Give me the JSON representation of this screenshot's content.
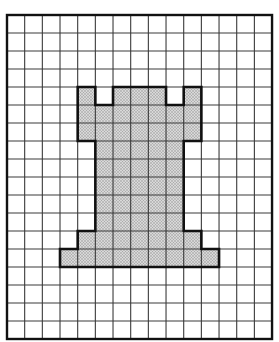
{
  "diagram": {
    "type": "grid-pixel-art",
    "grid": {
      "columns": 15,
      "rows": 18,
      "origin_px": [
        7,
        15
      ],
      "cell_width_px": 17.67,
      "cell_height_px": 18,
      "line_color": "#3a3a3a",
      "border_color": "#111111"
    },
    "shape": {
      "name": "rook-silhouette",
      "fill_color": "#cfcfcf",
      "dot_color": "#8a8a8a",
      "outline_color": "#111111",
      "outline_vertices_grid": [
        [
          4,
          4
        ],
        [
          5,
          4
        ],
        [
          5,
          5
        ],
        [
          6,
          5
        ],
        [
          6,
          4
        ],
        [
          9,
          4
        ],
        [
          9,
          5
        ],
        [
          10,
          5
        ],
        [
          10,
          4
        ],
        [
          11,
          4
        ],
        [
          11,
          7
        ],
        [
          10,
          7
        ],
        [
          10,
          12
        ],
        [
          11,
          12
        ],
        [
          11,
          13
        ],
        [
          12,
          13
        ],
        [
          12,
          14
        ],
        [
          3,
          14
        ],
        [
          3,
          13
        ],
        [
          4,
          13
        ],
        [
          4,
          12
        ],
        [
          5,
          12
        ],
        [
          5,
          7
        ],
        [
          4,
          7
        ]
      ]
    }
  }
}
